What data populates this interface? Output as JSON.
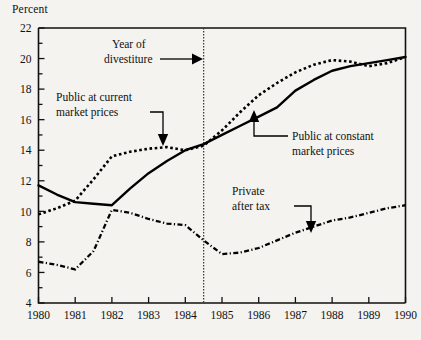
{
  "figure": {
    "y_axis_title": "Percent",
    "background_color": "#f4f3ef",
    "ink_color": "#000000"
  },
  "annotations": {
    "divestiture": {
      "line1": "Year of",
      "line2": "divestiture"
    },
    "public_current": {
      "line1": "Public at current",
      "line2": "market prices"
    },
    "public_constant": {
      "line1": "Public at  constant",
      "line2": "market prices"
    },
    "private_after_tax": {
      "line1": "Private",
      "line2": "after tax"
    }
  },
  "chart_data": {
    "type": "line",
    "title": "",
    "xlabel": "",
    "ylabel": "Percent",
    "xlim": [
      1980,
      1990
    ],
    "ylim": [
      4,
      22
    ],
    "ytick_major": [
      4,
      6,
      8,
      10,
      12,
      14,
      16,
      18,
      20,
      22
    ],
    "ytick_minor": [
      5,
      7,
      9,
      11,
      13,
      15,
      17,
      19,
      21
    ],
    "ytick_labels": [
      "4",
      "6",
      "8",
      "10",
      "12",
      "14",
      "16",
      "18",
      "20",
      "22"
    ],
    "xticks": [
      1980,
      1981,
      1982,
      1983,
      1984,
      1985,
      1986,
      1987,
      1988,
      1989,
      1990
    ],
    "xtick_labels": [
      "1980",
      "1981",
      "1982",
      "1983",
      "1984",
      "1985",
      "1986",
      "1987",
      "1988",
      "1989",
      "1990"
    ],
    "grid": false,
    "legend": "inline-annotations",
    "vertical_reference_line": {
      "x": 1984.5,
      "label": "Year of divestiture",
      "style": "dotted"
    },
    "series": [
      {
        "name": "Public at current market prices",
        "style": "dotted",
        "x": [
          1980,
          1980.5,
          1981,
          1981.5,
          1982,
          1982.5,
          1983,
          1983.5,
          1984,
          1984.5,
          1985,
          1985.5,
          1986,
          1986.5,
          1987,
          1987.5,
          1988,
          1988.5,
          1989,
          1989.5,
          1990
        ],
        "values": [
          9.8,
          10.2,
          10.7,
          12.1,
          13.6,
          13.9,
          14.1,
          14.2,
          14.0,
          14.3,
          15.3,
          16.5,
          17.6,
          18.4,
          19.1,
          19.6,
          19.9,
          19.8,
          19.5,
          19.7,
          20.1
        ]
      },
      {
        "name": "Public at constant market prices",
        "style": "solid",
        "x": [
          1980,
          1980.5,
          1981,
          1981.5,
          1982,
          1982.5,
          1983,
          1983.5,
          1984,
          1984.5,
          1985,
          1985.5,
          1986,
          1986.5,
          1987,
          1987.5,
          1988,
          1988.5,
          1989,
          1989.5,
          1990
        ],
        "values": [
          11.7,
          11.1,
          10.6,
          10.5,
          10.4,
          11.5,
          12.5,
          13.3,
          14.0,
          14.4,
          15.0,
          15.6,
          16.2,
          16.8,
          17.9,
          18.6,
          19.2,
          19.5,
          19.7,
          19.9,
          20.1
        ]
      },
      {
        "name": "Private after tax",
        "style": "dash-dot",
        "x": [
          1980,
          1980.5,
          1981,
          1981.5,
          1982,
          1982.5,
          1983,
          1983.5,
          1984,
          1984.5,
          1985,
          1985.5,
          1986,
          1986.5,
          1987,
          1987.5,
          1988,
          1988.5,
          1989,
          1989.5,
          1990
        ],
        "values": [
          6.7,
          6.5,
          6.2,
          7.4,
          10.1,
          9.9,
          9.5,
          9.2,
          9.1,
          8.1,
          7.2,
          7.3,
          7.6,
          8.1,
          8.6,
          9.0,
          9.4,
          9.6,
          9.9,
          10.2,
          10.4
        ]
      }
    ]
  }
}
